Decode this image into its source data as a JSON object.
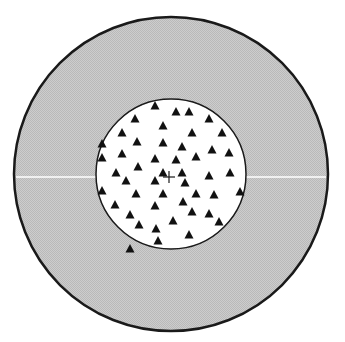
{
  "colors": {
    "background": "#ffffff",
    "outer_ring_fill": "#c6c6c6",
    "inner_fill": "#ffffff",
    "stroke": "#1a1a1a",
    "marker": "#111111",
    "axis_line": "#ffffff"
  },
  "outer_circle": {
    "cx": 171,
    "cy": 174,
    "r": 157
  },
  "inner_circle": {
    "cx": 171,
    "cy": 174,
    "r": 75
  },
  "horizontal_line": {
    "y": 177
  },
  "crosshair": {
    "x": 169,
    "y": 177,
    "size": 6
  },
  "markers": [
    [
      155,
      106
    ],
    [
      135,
      119
    ],
    [
      163,
      126
    ],
    [
      122,
      133
    ],
    [
      137,
      142
    ],
    [
      163,
      143
    ],
    [
      102,
      144
    ],
    [
      122,
      154
    ],
    [
      102,
      158
    ],
    [
      155,
      159
    ],
    [
      138,
      167
    ],
    [
      116,
      173
    ],
    [
      163,
      173
    ],
    [
      176,
      112
    ],
    [
      189,
      112
    ],
    [
      209,
      119
    ],
    [
      192,
      133
    ],
    [
      222,
      133
    ],
    [
      182,
      147
    ],
    [
      212,
      150
    ],
    [
      229,
      153
    ],
    [
      196,
      157
    ],
    [
      176,
      160
    ],
    [
      182,
      173
    ],
    [
      230,
      173
    ],
    [
      126,
      181
    ],
    [
      155,
      181
    ],
    [
      102,
      191
    ],
    [
      136,
      194
    ],
    [
      163,
      194
    ],
    [
      115,
      205
    ],
    [
      155,
      206
    ],
    [
      130,
      215
    ],
    [
      139,
      225
    ],
    [
      156,
      229
    ],
    [
      158,
      241
    ],
    [
      130,
      249
    ],
    [
      209,
      176
    ],
    [
      185,
      183
    ],
    [
      196,
      194
    ],
    [
      214,
      195
    ],
    [
      240,
      192
    ],
    [
      183,
      202
    ],
    [
      192,
      212
    ],
    [
      209,
      214
    ],
    [
      173,
      221
    ],
    [
      219,
      222
    ],
    [
      189,
      235
    ]
  ],
  "marker_shape": "triangle-up"
}
